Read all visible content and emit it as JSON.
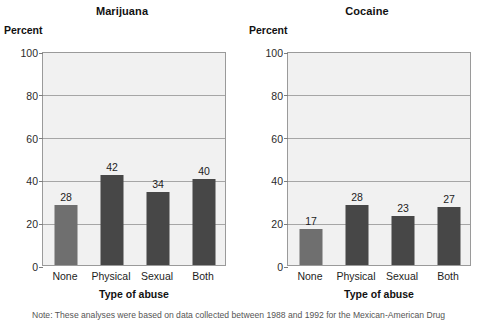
{
  "figure": {
    "note": "Note: These analyses were based on data collected between 1988 and 1992 for the Mexican-American Drug"
  },
  "chart_data": [
    {
      "type": "bar",
      "title": "Marijuana",
      "xlabel": "Type of abuse",
      "ylabel": "Percent",
      "categories": [
        "None",
        "Physical",
        "Sexual",
        "Both"
      ],
      "values": [
        28,
        42,
        34,
        40
      ],
      "ylim": [
        0,
        100
      ],
      "yticks": [
        0,
        20,
        40,
        60,
        80,
        100
      ],
      "ytick_labels": [
        "0",
        "20",
        "40",
        "60",
        "80",
        "100"
      ],
      "grid": true,
      "legend": "none",
      "bar_colors": [
        "#6f6f6f",
        "#474747",
        "#474747",
        "#474747"
      ],
      "plot_background": "#f1f1f1"
    },
    {
      "type": "bar",
      "title": "Cocaine",
      "xlabel": "Type of abuse",
      "ylabel": "Percent",
      "categories": [
        "None",
        "Physical",
        "Sexual",
        "Both"
      ],
      "values": [
        17,
        28,
        23,
        27
      ],
      "ylim": [
        0,
        100
      ],
      "yticks": [
        0,
        20,
        40,
        60,
        80,
        100
      ],
      "ytick_labels": [
        "0",
        "20",
        "40",
        "60",
        "80",
        "100"
      ],
      "grid": true,
      "legend": "none",
      "bar_colors": [
        "#6f6f6f",
        "#474747",
        "#474747",
        "#474747"
      ],
      "plot_background": "#f1f1f1"
    }
  ]
}
